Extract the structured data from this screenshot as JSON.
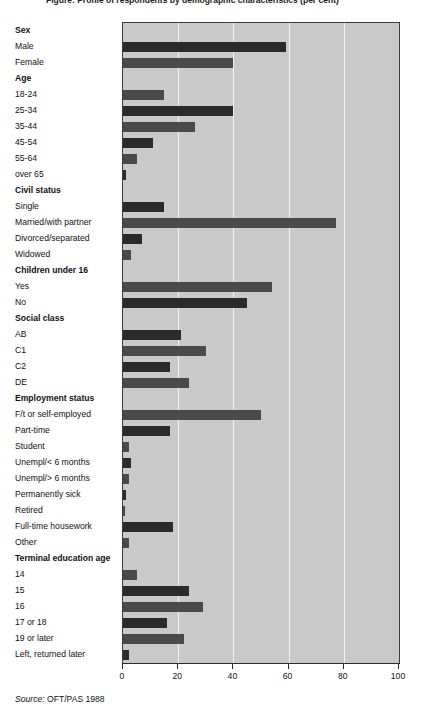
{
  "chart_data": {
    "type": "bar",
    "orientation": "horizontal",
    "title": "Figure: Profile of respondents by demographic characteristics (per cent)",
    "xlabel": "",
    "ylabel": "",
    "xlim": [
      0,
      100
    ],
    "xticks": [
      0,
      20,
      40,
      60,
      80,
      100
    ],
    "xtick_labels": [
      "0",
      "20",
      "40",
      "60",
      "80",
      "100"
    ],
    "grid": true,
    "gridlines_axis": "x",
    "legend": "none",
    "source": "Source: OFT/PAS 1988",
    "source_word": "Source:",
    "source_rest": " OFT/PAS 1988",
    "groups": [
      {
        "name": "Sex",
        "categories": [
          "Male",
          "Female"
        ],
        "values": [
          59,
          40
        ]
      },
      {
        "name": "Age",
        "categories": [
          "18-24",
          "25-34",
          "35-44",
          "45-54",
          "55-64",
          "over 65"
        ],
        "values": [
          15,
          40,
          26,
          11,
          5,
          1
        ]
      },
      {
        "name": "Civil status",
        "categories": [
          "Single",
          "Married/with partner",
          "Divorced/separated",
          "Widowed"
        ],
        "values": [
          15,
          77,
          7,
          3
        ]
      },
      {
        "name": "Children under 16",
        "categories": [
          "Yes",
          "No"
        ],
        "values": [
          54,
          45
        ]
      },
      {
        "name": "Social class",
        "categories": [
          "AB",
          "C1",
          "C2",
          "DE"
        ],
        "values": [
          21,
          30,
          17,
          24
        ]
      },
      {
        "name": "Employment status",
        "categories": [
          "F/t or self-employed",
          "Part-time",
          "Student",
          "Unempl/< 6 months",
          "Unempl/> 6 months",
          "Permanently sick",
          "Retired",
          "Full-time housework",
          "Other"
        ],
        "values": [
          50,
          17,
          2,
          3,
          2,
          1,
          0.5,
          18,
          2
        ]
      },
      {
        "name": "Terminal education age",
        "categories": [
          "14",
          "15",
          "16",
          "17 or 18",
          "19 or later",
          "Left, returned later"
        ],
        "values": [
          5,
          24,
          29,
          16,
          22,
          2
        ]
      }
    ],
    "colors": {
      "plot_background": "#c9c9c9",
      "bar_fill": "#4a4a4a",
      "bar_fill_alt": "#2b2b2b",
      "gridline": "#f2f2f2",
      "axis": "#2b2b2b",
      "text": "#111111"
    }
  }
}
